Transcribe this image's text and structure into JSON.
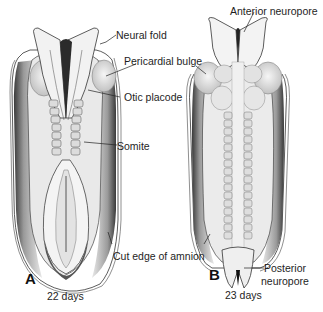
{
  "figure": {
    "panels": [
      {
        "letter": "A",
        "age": "22 days"
      },
      {
        "letter": "B",
        "age": "23 days"
      }
    ],
    "labels": {
      "neural_fold": "Neural fold",
      "pericardial_bulge": "Pericardial bulge",
      "otic_placode": "Otic placode",
      "somite": "Somite",
      "cut_edge_of_amnion": "Cut edge of amnion",
      "anterior_neuropore": "Anterior neuropore",
      "posterior_neuropore_line1": "Posterior",
      "posterior_neuropore_line2": "neuropore"
    },
    "colors": {
      "background": "#ffffff",
      "embryo_fill": "#ececec",
      "shade": "#5a5a5a",
      "outline": "#2a2a2a"
    }
  }
}
